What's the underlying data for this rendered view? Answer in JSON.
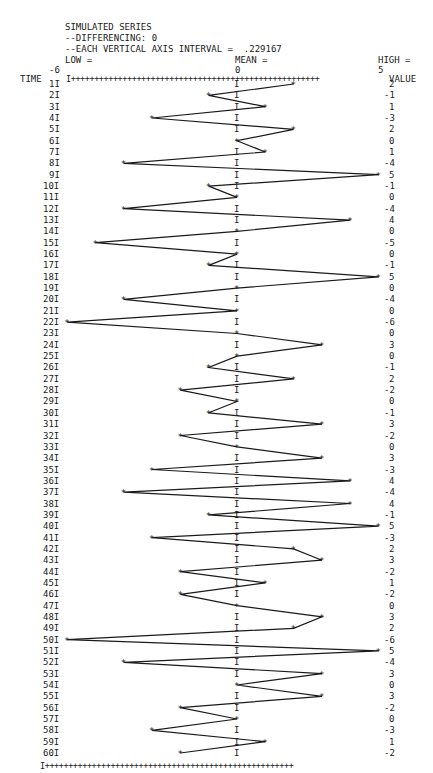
{
  "header": {
    "title": "SIMULATED SERIES",
    "differencing": "--DIFFERENCING: 0",
    "interval": "--EACH VERTICAL AXIS INTERVAL =  .229167",
    "low_label": "LOW =",
    "mean_label": "MEAN =",
    "high_label": "HIGH =",
    "low_value": "-6",
    "mean_value": "0",
    "high_value": "5"
  },
  "axis": {
    "time_label": "TIME",
    "value_label": "VALUE",
    "rule": "I+++++++++++++++++++++++++++++++++++++++++++++++++++++",
    "bottom_rule": "I+++++++++++++++++++++++++++++++++++++++++++++++++++++"
  },
  "chart_data": {
    "type": "line",
    "title": "SIMULATED SERIES",
    "subtitle": "DIFFERENCING: 0; EACH VERTICAL AXIS INTERVAL = .229167",
    "xlabel": "TIME",
    "ylabel": "VALUE",
    "orientation": "horizontal-values, time runs downward",
    "value_range": [
      -6,
      5
    ],
    "low": -6,
    "mean": 0,
    "high": 5,
    "x": [
      1,
      2,
      3,
      4,
      5,
      6,
      7,
      8,
      9,
      10,
      11,
      12,
      13,
      14,
      15,
      16,
      17,
      18,
      19,
      20,
      21,
      22,
      23,
      24,
      25,
      26,
      27,
      28,
      29,
      30,
      31,
      32,
      33,
      34,
      35,
      36,
      37,
      38,
      39,
      40,
      41,
      42,
      43,
      44,
      45,
      46,
      47,
      48,
      49,
      50,
      51,
      52,
      53,
      54,
      55,
      56,
      57,
      58,
      59,
      60
    ],
    "values": [
      2,
      -1,
      1,
      -3,
      2,
      0,
      1,
      -4,
      5,
      -1,
      0,
      -4,
      4,
      0,
      -5,
      0,
      -1,
      5,
      0,
      -4,
      0,
      -6,
      0,
      3,
      0,
      -1,
      2,
      -2,
      0,
      -1,
      3,
      -2,
      0,
      3,
      -3,
      4,
      -4,
      4,
      -1,
      5,
      -3,
      2,
      3,
      -2,
      1,
      -2,
      0,
      3,
      2,
      -6,
      5,
      -4,
      3,
      0,
      3,
      -2,
      0,
      -3,
      1,
      -2
    ],
    "grid": false
  }
}
